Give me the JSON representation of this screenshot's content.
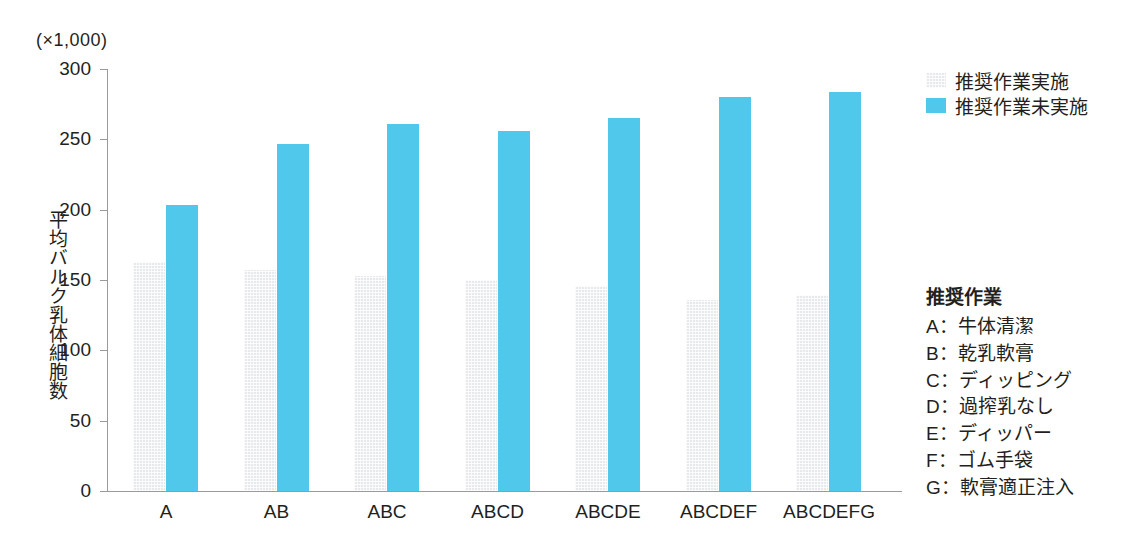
{
  "chart_data": {
    "type": "bar",
    "title": "",
    "unit_note": "(×1,000)",
    "xlabel": "",
    "ylabel": "平均バルク乳体細胞数",
    "ylim": [
      0,
      300
    ],
    "yticks": [
      0,
      50,
      100,
      150,
      200,
      250,
      300
    ],
    "ytick_labels": [
      "0",
      "50",
      "100",
      "150",
      "200",
      "250",
      "300"
    ],
    "grid": false,
    "legend_position": "top-right",
    "categories": [
      "A",
      "AB",
      "ABC",
      "ABCD",
      "ABCDE",
      "ABCDEF",
      "ABCDEFG"
    ],
    "series": [
      {
        "name": "推奨作業実施",
        "color": "#e7e9ec",
        "values": [
          163,
          157,
          153,
          150,
          146,
          136,
          139
        ]
      },
      {
        "name": "推奨作業未実施",
        "color": "#4fc8ec",
        "values": [
          203,
          247,
          261,
          256,
          265,
          280,
          284
        ]
      }
    ]
  },
  "legend": {
    "items": [
      {
        "label": "推奨作業実施"
      },
      {
        "label": "推奨作業未実施"
      }
    ]
  },
  "keylist": {
    "title": "推奨作業",
    "items": [
      {
        "label": "A：牛体清潔"
      },
      {
        "label": "B：乾乳軟膏"
      },
      {
        "label": "C：ディッピング"
      },
      {
        "label": "D：過搾乳なし"
      },
      {
        "label": "E：ディッパー"
      },
      {
        "label": "F：ゴム手袋"
      },
      {
        "label": "G：軟膏適正注入"
      }
    ]
  },
  "colors": {
    "accent_cyan": "#4fc8ec",
    "bar_gray": "#e7e9ec",
    "axis": "#9a9a9a",
    "text": "#231f20"
  }
}
